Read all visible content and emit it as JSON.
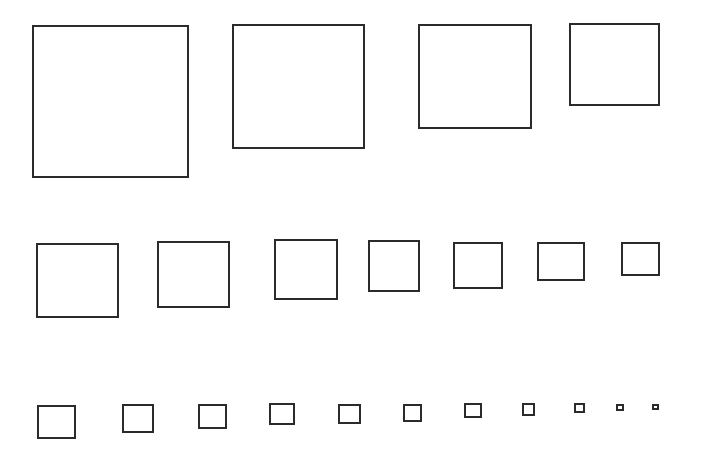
{
  "diagram": {
    "stroke_color": "#2b2b2b",
    "background": "#ffffff",
    "rows": [
      {
        "name": "row-1",
        "squares": [
          {
            "x": 32,
            "y": 25,
            "w": 157,
            "h": 153
          },
          {
            "x": 232,
            "y": 24,
            "w": 133,
            "h": 125
          },
          {
            "x": 418,
            "y": 24,
            "w": 114,
            "h": 105
          },
          {
            "x": 569,
            "y": 23,
            "w": 91,
            "h": 83
          }
        ]
      },
      {
        "name": "row-2",
        "squares": [
          {
            "x": 36,
            "y": 243,
            "w": 83,
            "h": 75
          },
          {
            "x": 157,
            "y": 241,
            "w": 73,
            "h": 67
          },
          {
            "x": 274,
            "y": 239,
            "w": 64,
            "h": 61
          },
          {
            "x": 368,
            "y": 240,
            "w": 52,
            "h": 52
          },
          {
            "x": 453,
            "y": 242,
            "w": 50,
            "h": 47
          },
          {
            "x": 537,
            "y": 242,
            "w": 48,
            "h": 39
          },
          {
            "x": 621,
            "y": 242,
            "w": 39,
            "h": 34
          }
        ]
      },
      {
        "name": "row-3",
        "squares": [
          {
            "x": 37,
            "y": 405,
            "w": 39,
            "h": 34
          },
          {
            "x": 122,
            "y": 404,
            "w": 32,
            "h": 29
          },
          {
            "x": 198,
            "y": 404,
            "w": 29,
            "h": 25
          },
          {
            "x": 269,
            "y": 403,
            "w": 26,
            "h": 22
          },
          {
            "x": 338,
            "y": 404,
            "w": 23,
            "h": 20
          },
          {
            "x": 403,
            "y": 404,
            "w": 19,
            "h": 18
          },
          {
            "x": 464,
            "y": 403,
            "w": 18,
            "h": 15
          },
          {
            "x": 522,
            "y": 403,
            "w": 13,
            "h": 13
          },
          {
            "x": 574,
            "y": 403,
            "w": 11,
            "h": 10
          },
          {
            "x": 616,
            "y": 404,
            "w": 8,
            "h": 7
          },
          {
            "x": 652,
            "y": 404,
            "w": 7,
            "h": 6
          }
        ]
      }
    ]
  }
}
